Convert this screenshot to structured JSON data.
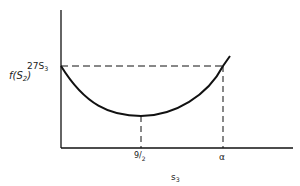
{
  "diagram": {
    "type": "function-curve",
    "y_axis": {
      "label_main": "f(S",
      "label_sub": "2",
      "label_close": ")",
      "tick_label_main": "27S",
      "tick_label_sub": "3"
    },
    "x_axis": {
      "label_main": "s",
      "label_sub": "3",
      "ticks": [
        {
          "num": "9",
          "slash": "/",
          "den": "2"
        },
        {
          "label": "α"
        }
      ]
    },
    "colors": {
      "line": "#111111",
      "background": "#ffffff"
    }
  }
}
